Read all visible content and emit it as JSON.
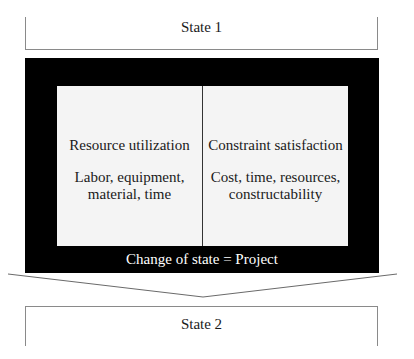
{
  "diagram": {
    "state_start": {
      "label": "State 1"
    },
    "project": {
      "caption": "Change of state = Project",
      "columns": [
        {
          "title": "Resource utilization",
          "detail_lines": [
            "Labor, equipment,",
            "material, time"
          ]
        },
        {
          "title": "Constraint satisfaction",
          "detail_lines": [
            "Cost, time, resources,",
            "constructability"
          ]
        }
      ]
    },
    "state_end": {
      "label": "State 2"
    },
    "colors": {
      "project_box": "#000000",
      "inner_panel": "#f4f4f4",
      "border": "#8a8a8a"
    }
  }
}
